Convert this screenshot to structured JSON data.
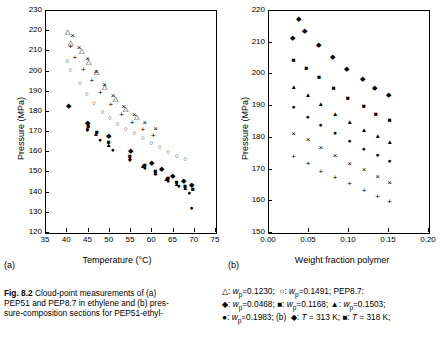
{
  "figure": {
    "label": "Fig. 8.2",
    "caption_lines": [
      "Cloud-point measurements of (a)",
      "PEP51 and PEP8.7 in ethylene and (b) pres-",
      "sure-composition sections for PEP51-ethyl-"
    ]
  },
  "panels": [
    {
      "letter": "(a)",
      "xlabel": "Temperature (°C)",
      "ylabel": "Pressure (MPa)",
      "xlim": [
        35,
        75
      ],
      "ylim": [
        120,
        230
      ],
      "xticks": [
        "35",
        "40",
        "45",
        "50",
        "55",
        "60",
        "65",
        "70",
        "75"
      ],
      "yticks": [
        "120",
        "130",
        "140",
        "150",
        "160",
        "170",
        "180",
        "190",
        "200",
        "210",
        "220",
        "230"
      ]
    },
    {
      "letter": "(b)",
      "xlabel": "Weight fraction polymer",
      "ylabel": "Pressure (MPa)",
      "xlim": [
        0.0,
        0.2
      ],
      "ylim": [
        150,
        220
      ],
      "xticks": [
        "0.00",
        "0.05",
        "0.10",
        "0.15",
        "0.20"
      ],
      "yticks": [
        "150",
        "160",
        "170",
        "180",
        "190",
        "200",
        "210",
        "220"
      ]
    }
  ],
  "legend_lines": [
    "△: w_p=0.1230;  ○: w_p=0.1491; PEP8.7:",
    "◆: w_p=0.0468; ■: w_p=0.1168; ▲: w_p=0.1503;",
    "●: w_p=0.1983; (b)  ◆: T = 313 K; ■: T = 318 K;"
  ],
  "chart_data": [
    {
      "type": "scatter",
      "panel": "(a)",
      "title": "Cloud-point measurements of PEP51 and PEP8.7 in ethylene",
      "xlabel": "Temperature (°C)",
      "ylabel": "Pressure (MPa)",
      "xlim": [
        35,
        75
      ],
      "ylim": [
        120,
        230
      ],
      "grid": false,
      "legend_position": "below-figure",
      "series": [
        {
          "name": "w_p=0.1230 (PEP51, open triangle)",
          "marker": "open-triangle",
          "points": [
            [
              40.2,
              218.5
            ],
            [
              41.0,
              213.0
            ],
            [
              43.5,
              209.0
            ],
            [
              45.2,
              203.5
            ],
            [
              47.0,
              199.0
            ],
            [
              49.0,
              191.5
            ],
            [
              51.5,
              185.5
            ],
            [
              54.0,
              180.5
            ],
            [
              56.5,
              176.5
            ]
          ]
        },
        {
          "name": "w_p=0.1491 (PEP51, open circle)",
          "marker": "open-circle",
          "points": [
            [
              40.2,
              204.0
            ],
            [
              41.0,
              200.0
            ],
            [
              43.2,
              193.5
            ],
            [
              44.8,
              188.0
            ],
            [
              46.5,
              183.5
            ],
            [
              48.5,
              179.0
            ],
            [
              50.2,
              176.0
            ],
            [
              52.0,
              173.0
            ],
            [
              54.0,
              170.5
            ],
            [
              56.0,
              168.5
            ],
            [
              58.0,
              166.0
            ],
            [
              60.0,
              163.5
            ],
            [
              62.0,
              161.5
            ],
            [
              64.0,
              159.0
            ],
            [
              66.0,
              157.0
            ],
            [
              68.0,
              155.5
            ]
          ]
        },
        {
          "name": "w_p=0.0468 (PEP8.7, filled diamond)",
          "marker": "filled-diamond",
          "points": [
            [
              40.5,
              182.0
            ],
            [
              45.0,
              173.5
            ],
            [
              50.0,
              167.0
            ],
            [
              55.0,
              159.5
            ],
            [
              60.0,
              153.5
            ],
            [
              62.5,
              150.5
            ],
            [
              65.0,
              147.5
            ],
            [
              67.5,
              145.0
            ],
            [
              69.5,
              143.0
            ]
          ]
        },
        {
          "name": "w_p=0.1168 (PEP8.7, filled square)",
          "marker": "filled-square",
          "points": [
            [
              45.2,
              172.0
            ],
            [
              47.2,
              169.0
            ],
            [
              50.0,
              164.0
            ],
            [
              55.0,
              157.0
            ],
            [
              58.5,
              152.5
            ],
            [
              61.0,
              149.5
            ],
            [
              64.0,
              146.5
            ],
            [
              66.0,
              144.5
            ],
            [
              68.0,
              142.5
            ],
            [
              69.8,
              141.0
            ]
          ]
        },
        {
          "name": "w_p=0.1503 (PEP8.7, filled triangle)",
          "marker": "filled-triangle",
          "points": [
            [
              45.0,
              171.0
            ],
            [
              47.0,
              168.0
            ],
            [
              50.0,
              162.5
            ],
            [
              55.0,
              156.0
            ],
            [
              58.0,
              152.0
            ],
            [
              61.0,
              148.5
            ],
            [
              63.5,
              146.0
            ],
            [
              66.0,
              143.5
            ],
            [
              68.0,
              141.5
            ]
          ]
        },
        {
          "name": "w_p=0.1983 (PEP8.7, filled circle)",
          "marker": "filled-circle",
          "points": [
            [
              45.0,
              170.0
            ],
            [
              48.0,
              165.0
            ],
            [
              51.0,
              160.0
            ],
            [
              55.0,
              155.0
            ],
            [
              58.5,
              151.0
            ],
            [
              61.0,
              148.0
            ],
            [
              64.0,
              145.0
            ],
            [
              66.5,
              142.5
            ],
            [
              69.0,
              139.0
            ],
            [
              69.5,
              131.5
            ]
          ]
        },
        {
          "name": "additional cross symbols (PEP51)",
          "marker": "cross",
          "points": [
            [
              41.0,
              211.5
            ],
            [
              42.0,
              206.0
            ],
            [
              44.0,
              200.5
            ],
            [
              46.0,
              195.0
            ],
            [
              48.0,
              189.0
            ],
            [
              50.5,
              183.0
            ],
            [
              53.0,
              178.0
            ],
            [
              55.5,
              174.0
            ],
            [
              58.0,
              170.5
            ],
            [
              60.5,
              167.5
            ]
          ]
        },
        {
          "name": "additional x symbols (PEP51)",
          "marker": "times",
          "points": [
            [
              41.5,
              217.0
            ],
            [
              43.0,
              211.0
            ],
            [
              45.0,
              205.5
            ],
            [
              47.0,
              199.5
            ],
            [
              49.0,
              193.0
            ],
            [
              51.0,
              187.5
            ],
            [
              53.5,
              182.0
            ],
            [
              56.0,
              178.0
            ],
            [
              58.5,
              174.0
            ],
            [
              61.0,
              171.0
            ]
          ]
        }
      ]
    },
    {
      "type": "scatter",
      "panel": "(b)",
      "title": "Pressure-composition sections for PEP51-ethylene",
      "xlabel": "Weight fraction polymer",
      "ylabel": "Pressure (MPa)",
      "xlim": [
        0.0,
        0.2
      ],
      "ylim": [
        150,
        220
      ],
      "grid": false,
      "legend_position": "below-figure",
      "series": [
        {
          "name": "T = 313 K (filled diamond)",
          "marker": "filled-diamond",
          "points": [
            [
              0.03,
              211.0
            ],
            [
              0.045,
              213.0
            ],
            [
              0.063,
              208.5
            ],
            [
              0.08,
              205.0
            ],
            [
              0.098,
              201.0
            ],
            [
              0.118,
              198.0
            ],
            [
              0.133,
              195.0
            ],
            [
              0.15,
              193.0
            ]
          ]
        },
        {
          "name": "T = 318 K (filled square)",
          "marker": "filled-square",
          "points": [
            [
              0.032,
              204.0
            ],
            [
              0.048,
              201.5
            ],
            [
              0.064,
              198.5
            ],
            [
              0.082,
              195.0
            ],
            [
              0.1,
              192.0
            ],
            [
              0.12,
              189.5
            ],
            [
              0.135,
              187.0
            ],
            [
              0.152,
              185.0
            ]
          ]
        },
        {
          "name": "higher T (filled triangle)",
          "marker": "filled-triangle",
          "points": [
            [
              0.032,
              195.5
            ],
            [
              0.05,
              193.0
            ],
            [
              0.066,
              190.0
            ],
            [
              0.084,
              187.0
            ],
            [
              0.102,
              184.5
            ],
            [
              0.12,
              182.0
            ],
            [
              0.137,
              180.0
            ],
            [
              0.152,
              178.0
            ]
          ]
        },
        {
          "name": "higher T (filled circle)",
          "marker": "filled-circle",
          "points": [
            [
              0.032,
              189.0
            ],
            [
              0.05,
              186.0
            ],
            [
              0.066,
              183.5
            ],
            [
              0.084,
              181.0
            ],
            [
              0.102,
              178.5
            ],
            [
              0.12,
              176.0
            ],
            [
              0.137,
              174.0
            ],
            [
              0.152,
              172.0
            ]
          ]
        },
        {
          "name": "higher T (times)",
          "marker": "times",
          "points": [
            [
              0.032,
              181.0
            ],
            [
              0.05,
              179.0
            ],
            [
              0.066,
              176.5
            ],
            [
              0.084,
              174.0
            ],
            [
              0.102,
              171.5
            ],
            [
              0.12,
              169.5
            ],
            [
              0.137,
              167.5
            ],
            [
              0.152,
              165.5
            ]
          ]
        },
        {
          "name": "highest T (cross)",
          "marker": "cross",
          "points": [
            [
              0.032,
              173.5
            ],
            [
              0.05,
              171.5
            ],
            [
              0.066,
              169.0
            ],
            [
              0.084,
              167.0
            ],
            [
              0.102,
              165.0
            ],
            [
              0.12,
              163.0
            ],
            [
              0.137,
              161.0
            ],
            [
              0.152,
              159.5
            ]
          ]
        },
        {
          "name": "top point (filled diamond, outlier)",
          "marker": "filled-diamond",
          "points": [
            [
              0.038,
              217.0
            ]
          ]
        }
      ]
    }
  ]
}
